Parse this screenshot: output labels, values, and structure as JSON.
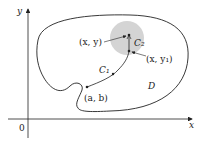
{
  "figure": {
    "axes": {
      "x_label": "x",
      "y_label": "y",
      "origin_label": "0"
    },
    "region_label": "D",
    "points": {
      "start": "(a, b)",
      "point": "(x, y)",
      "point1": "(x, y₁)"
    },
    "curves": {
      "c1": "C₁",
      "c2": "C₂"
    },
    "colors": {
      "disk": "#d4d4d4",
      "stroke": "#222222"
    }
  }
}
